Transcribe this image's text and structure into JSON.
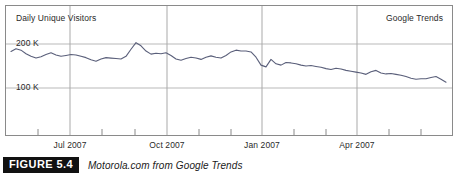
{
  "figure": {
    "tag": "FIGURE 5.4",
    "caption": "Motorola.com from Google Trends"
  },
  "chart_labels": {
    "title_left": "Daily Unique Visitors",
    "title_right": "Google Trends"
  },
  "chart_data": {
    "type": "line",
    "title": "Daily Unique Visitors",
    "subtitle": "Google Trends",
    "xlabel": "",
    "ylabel": "Daily Unique Visitors",
    "ylim": [
      0,
      250000
    ],
    "yticks": [
      100000,
      200000
    ],
    "ytick_labels": [
      "100 K",
      "200 K"
    ],
    "grid": true,
    "legend": "none",
    "xticks": [
      "Jul 2007",
      "Oct 2007",
      "Jan 2007",
      "Apr 2007"
    ],
    "xtick_positions_px": [
      70,
      167,
      262,
      357
    ],
    "annotations": [
      {
        "text": "Daily Unique Visitors",
        "position": "top-left"
      },
      {
        "text": "Google Trends",
        "position": "top-right"
      }
    ],
    "series": [
      {
        "name": "Motorola.com daily unique visitors",
        "color": "#5a5f7a",
        "x": [
          6,
          11,
          16,
          21,
          26,
          31,
          36,
          41,
          46,
          51,
          56,
          61,
          66,
          71,
          76,
          81,
          86,
          91,
          96,
          101,
          106,
          111,
          116,
          121,
          126,
          131,
          136,
          141,
          146,
          151,
          156,
          161,
          166,
          171,
          176,
          181,
          186,
          191,
          196,
          201,
          206,
          211,
          216,
          221,
          226,
          231,
          236,
          241,
          246,
          251,
          256,
          261,
          266,
          271,
          276,
          281,
          286,
          291,
          296,
          301,
          306,
          311,
          316,
          321,
          326,
          331,
          336,
          341,
          346,
          351,
          356,
          361,
          366,
          371,
          376,
          381,
          386,
          391,
          396,
          401,
          406,
          411,
          416,
          421,
          426,
          431,
          436,
          441
        ],
        "values": [
          183000,
          189000,
          186000,
          178000,
          172000,
          168000,
          171000,
          176000,
          180000,
          175000,
          172000,
          174000,
          176000,
          175000,
          172000,
          169000,
          164000,
          161000,
          166000,
          169000,
          168000,
          167000,
          166000,
          172000,
          188000,
          203000,
          196000,
          184000,
          177000,
          179000,
          178000,
          180000,
          174000,
          166000,
          163000,
          167000,
          170000,
          168000,
          165000,
          170000,
          173000,
          170000,
          168000,
          174000,
          182000,
          186000,
          184000,
          184000,
          182000,
          170000,
          152000,
          148000,
          165000,
          155000,
          152000,
          158000,
          157000,
          155000,
          152000,
          150000,
          151000,
          149000,
          147000,
          144000,
          142000,
          145000,
          143000,
          140000,
          138000,
          136000,
          134000,
          131000,
          137000,
          140000,
          134000,
          132000,
          133000,
          131000,
          129000,
          126000,
          122000,
          120000,
          121000,
          121000,
          124000,
          126000,
          120000,
          113000
        ]
      }
    ]
  }
}
